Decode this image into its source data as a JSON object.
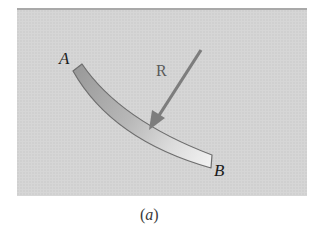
{
  "figure": {
    "caption": "(a)",
    "caption_open": "(",
    "caption_letter": "a",
    "caption_close": ")",
    "labels": {
      "end_a": "A",
      "end_b": "B",
      "force": "R"
    },
    "colors": {
      "panel_background": "#d6d6d6",
      "panel_top_border": "#a9a9a9",
      "beam_dark": "#9c9c9c",
      "beam_light": "#efefef",
      "beam_outline": "#6e6e6e",
      "arrow": "#7d7d7d",
      "text": "#1c1c1c"
    }
  }
}
